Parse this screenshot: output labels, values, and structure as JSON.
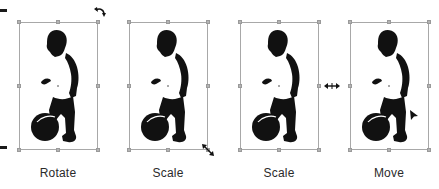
{
  "figure_title": "Transform handles on a selected image",
  "panels": [
    {
      "id": "rotate",
      "label": "Rotate",
      "cursor": "rotate-cursor-icon",
      "cursor_position": "top-right corner"
    },
    {
      "id": "scale-corner",
      "label": "Scale",
      "cursor": "diagonal-resize-cursor-icon",
      "cursor_position": "bottom-right corner"
    },
    {
      "id": "scale-side",
      "label": "Scale",
      "cursor": "horizontal-resize-cursor-icon",
      "cursor_position": "middle-right handle"
    },
    {
      "id": "move",
      "label": "Move",
      "cursor": "arrow-pointer-cursor-icon",
      "cursor_position": "inside selection"
    }
  ],
  "colors": {
    "silhouette": "#111111",
    "bounding_box": "#a8a8a8",
    "handle": "#b4b4b4",
    "label_text": "#2a2a2a",
    "background": "#ffffff"
  }
}
